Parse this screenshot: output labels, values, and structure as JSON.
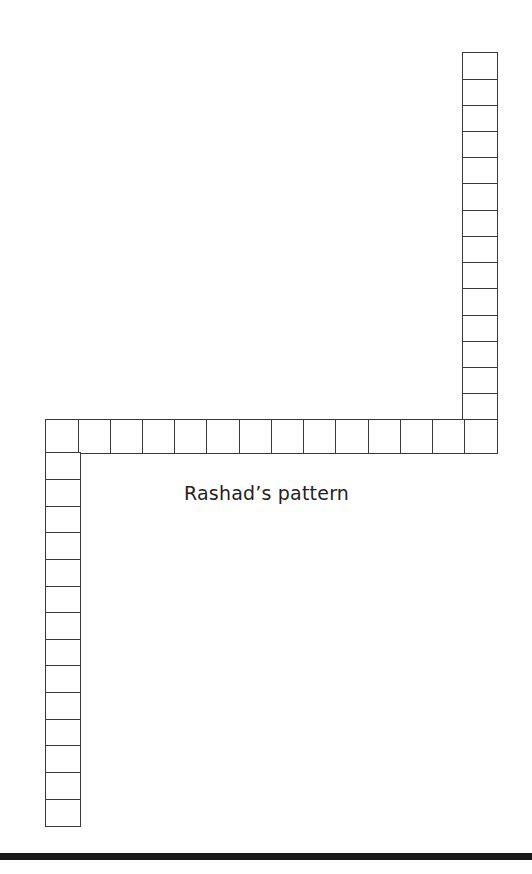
{
  "page": {
    "width": 532,
    "height": 874,
    "background_color": "#ffffff"
  },
  "caption": {
    "text": "Rashad’s pattern",
    "color": "#231f20",
    "x": 184,
    "y": 482
  },
  "figure": {
    "name": "rashad-pattern",
    "stroke_color": "#3a3a3a",
    "fill_color": "#ffffff",
    "segments": [
      {
        "id": "top-right-column",
        "orientation": "vertical",
        "cell_count": 14,
        "x": 463,
        "y": 53,
        "width": 34,
        "height": 367
      },
      {
        "id": "horizontal-row",
        "orientation": "horizontal",
        "cell_count": 14,
        "x": 46,
        "y": 420,
        "width": 451,
        "height": 33
      },
      {
        "id": "bottom-left-column",
        "orientation": "vertical",
        "cell_count": 14,
        "x": 46,
        "y": 453,
        "width": 34,
        "height": 373
      }
    ]
  },
  "bottom_rule": {
    "color": "#1a1a1a",
    "x": 0,
    "y": 853,
    "width": 532,
    "height": 7
  }
}
